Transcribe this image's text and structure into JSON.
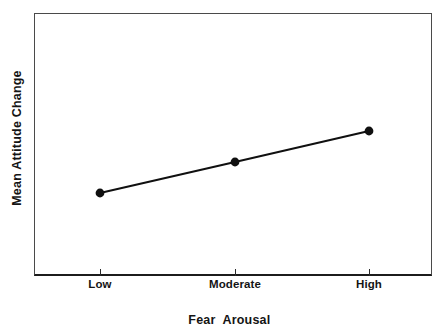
{
  "chart_data": {
    "type": "line",
    "title": "",
    "subtitle": "",
    "xlabel": "Fear  Arousal",
    "ylabel": "Mean Attitude Change",
    "categories": [
      "Low",
      "Moderate",
      "High"
    ],
    "series": [
      {
        "name": "Mean Attitude Change",
        "values": [
          2.5,
          3.7,
          4.8
        ],
        "marker": "filled-circle",
        "color": "#101010"
      }
    ],
    "x_tick_labels": [
      "Low",
      "Moderate",
      "High"
    ],
    "y_tick_labels": [],
    "ylim": [
      0,
      10
    ],
    "xlim": [
      0,
      4
    ],
    "grid": false,
    "legend": false,
    "legend_position": "none",
    "annotations": [],
    "point_pixels": [
      {
        "label": "Low",
        "x": 66,
        "y": 180
      },
      {
        "label": "Moderate",
        "x": 201,
        "y": 149
      },
      {
        "label": "High",
        "x": 335,
        "y": 118
      }
    ],
    "tick_pixels": [
      66,
      201,
      335
    ],
    "axis_color": "#1c1c1c",
    "frame_color": "#4a4a4a",
    "background_color": "#ffffff"
  },
  "figure": {
    "y_axis_title": "Mean Attitude Change",
    "x_axis_title": "Fear  Arousal"
  }
}
